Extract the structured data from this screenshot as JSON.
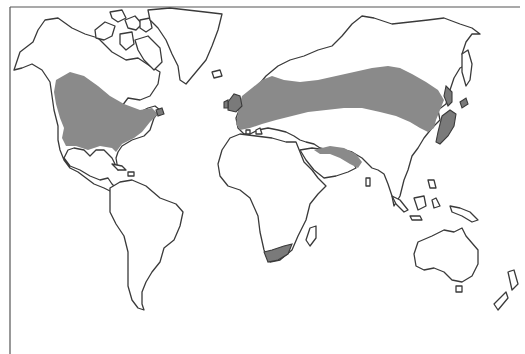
{
  "map": {
    "type": "world-outline-distribution-map",
    "colors": {
      "background": "#ffffff",
      "outline": "#3a3a3a",
      "shaded_region": "#8a8a8a"
    },
    "shaded_regions": [
      {
        "name": "north-america-temperate-band"
      },
      {
        "name": "eurasia-temperate-band"
      },
      {
        "name": "japan"
      },
      {
        "name": "persian-gulf-region"
      },
      {
        "name": "south-africa-cape"
      }
    ]
  }
}
